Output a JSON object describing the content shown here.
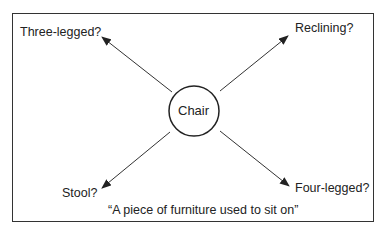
{
  "center": {
    "label": "Chair"
  },
  "branches": [
    {
      "position": "top-left",
      "label": "Three-legged?"
    },
    {
      "position": "top-right",
      "label": "Reclining?"
    },
    {
      "position": "bottom-left",
      "label": "Stool?"
    },
    {
      "position": "bottom-right",
      "label": "Four-legged?"
    }
  ],
  "caption": "“A piece of furniture used to sit on”"
}
